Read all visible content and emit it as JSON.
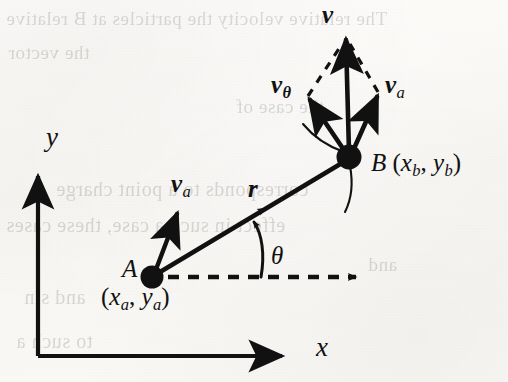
{
  "figure": {
    "type": "vector-decomposition-diagram",
    "background_note": "scanned textbook page with faint show-through text from the reverse side"
  },
  "axes": {
    "x_label": "x",
    "y_label": "y",
    "origin_px": [
      38,
      355
    ],
    "x_axis_tip_px": [
      295,
      355
    ],
    "y_axis_tip_px": [
      38,
      165
    ]
  },
  "points": {
    "a": {
      "name": "A",
      "label": "A",
      "coords_open": "(",
      "coords_x_base": "x",
      "coords_x_sub": "a",
      "coords_sep": ", ",
      "coords_y_base": "y",
      "coords_y_sub": "a",
      "coords_close": ")",
      "coords_text": "(xa, ya)",
      "px": [
        152,
        277
      ]
    },
    "b": {
      "name": "B",
      "label": "B",
      "coords_open": "(",
      "coords_x_base": "x",
      "coords_x_sub": "b",
      "coords_sep": ", ",
      "coords_y_base": "y",
      "coords_y_sub": "b",
      "coords_close": ")",
      "coords_text": "(xb, yb)",
      "px": [
        349,
        157
      ]
    }
  },
  "vectors": {
    "r": {
      "label_base": "r",
      "label": "r",
      "from": "A",
      "to": "B",
      "style": "solid",
      "midpoint_arrowhead": true
    },
    "va_at_a": {
      "label_base": "v",
      "label_sub": "a",
      "label": "va",
      "anchor": "A",
      "tip_px": [
        180,
        208
      ],
      "style": "solid"
    },
    "v_at_b": {
      "label_base": "v",
      "label_sub": "",
      "label": "v",
      "anchor": "B",
      "tip_px": [
        346,
        32
      ],
      "style": "solid"
    },
    "vtheta_at_b": {
      "label_base": "v",
      "label_sub": "θ",
      "label": "vθ",
      "anchor": "B",
      "tip_px": [
        305,
        92
      ],
      "style": "solid"
    },
    "va_at_b": {
      "label_base": "v",
      "label_sub": "a",
      "label": "va",
      "anchor": "B",
      "tip_px": [
        381,
        88
      ],
      "style": "solid"
    }
  },
  "angle": {
    "symbol": "θ",
    "from_ray": "dashed horizontal ray at A",
    "to_ray": "r (A to B)",
    "vertex": "A",
    "value_deg_estimate": 31
  },
  "construction": {
    "dashed_horizontal_ray": {
      "from_px": [
        165,
        277
      ],
      "to_px": [
        368,
        277
      ],
      "style": "dashed",
      "arrowhead": true
    },
    "parallelogram_dashes": [
      {
        "from": "vtheta_tip",
        "to": "v_tip",
        "style": "dashed"
      },
      {
        "from": "va_tip",
        "to": "v_tip",
        "style": "dashed"
      }
    ],
    "arcs_at_b": 2
  },
  "ghost_text": {
    "lines": [
      {
        "text": "The relative velocity the particles at B relative",
        "left": 6,
        "top": 8,
        "size": 19
      },
      {
        "text": "the vector",
        "left": 8,
        "top": 42,
        "size": 19
      },
      {
        "text": "corresponds to a point charge",
        "left": 56,
        "top": 178,
        "size": 20
      },
      {
        "text": "effect in such a case, these cases",
        "left": 6,
        "top": 214,
        "size": 20
      },
      {
        "text": "and sin",
        "left": 24,
        "top": 286,
        "size": 20
      },
      {
        "text": "to such a",
        "left": 16,
        "top": 330,
        "size": 20
      },
      {
        "text": "the case of",
        "left": 236,
        "top": 96,
        "size": 19
      },
      {
        "text": "and",
        "left": 368,
        "top": 254,
        "size": 19
      }
    ]
  },
  "colors": {
    "ink": "#111111",
    "paper": "#fbfaf7",
    "ghost_ink": "#2b2b2b"
  }
}
